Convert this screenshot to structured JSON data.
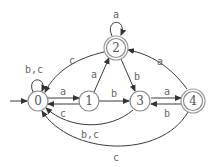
{
  "diagram": {
    "type": "finite-automaton",
    "states": [
      {
        "id": "0",
        "label": "0",
        "x": 38,
        "y": 101,
        "accepting": false,
        "initial": true
      },
      {
        "id": "1",
        "label": "1",
        "x": 89,
        "y": 101,
        "accepting": false,
        "initial": false
      },
      {
        "id": "2",
        "label": "2",
        "x": 116,
        "y": 48,
        "accepting": true,
        "initial": false
      },
      {
        "id": "3",
        "label": "3",
        "x": 140,
        "y": 101,
        "accepting": false,
        "initial": false
      },
      {
        "id": "4",
        "label": "4",
        "x": 193,
        "y": 101,
        "accepting": true,
        "initial": false
      }
    ],
    "transitions": [
      {
        "from": "0",
        "to": "0",
        "label": "b,c"
      },
      {
        "from": "0",
        "to": "1",
        "label": "a"
      },
      {
        "from": "1",
        "to": "0",
        "label": "c"
      },
      {
        "from": "1",
        "to": "2",
        "label": "a"
      },
      {
        "from": "1",
        "to": "3",
        "label": "b"
      },
      {
        "from": "2",
        "to": "2",
        "label": "a"
      },
      {
        "from": "2",
        "to": "0",
        "label": "c"
      },
      {
        "from": "2",
        "to": "3",
        "label": "b"
      },
      {
        "from": "3",
        "to": "4",
        "label": "a"
      },
      {
        "from": "4",
        "to": "3",
        "label": "b"
      },
      {
        "from": "4",
        "to": "2",
        "label": "a"
      },
      {
        "from": "3",
        "to": "0",
        "label": "b,c"
      },
      {
        "from": "4",
        "to": "0",
        "label": "c"
      }
    ]
  },
  "labels": {
    "s0": "0",
    "s1": "1",
    "s2": "2",
    "s3": "3",
    "s4": "4",
    "e_00": "b,c",
    "e_01": "a",
    "e_10": "c",
    "e_12": "a",
    "e_13": "b",
    "e_22": "a",
    "e_20": "c",
    "e_23": "b",
    "e_34": "a",
    "e_43": "b",
    "e_42": "a",
    "e_30": "b,c",
    "e_40": "c"
  }
}
